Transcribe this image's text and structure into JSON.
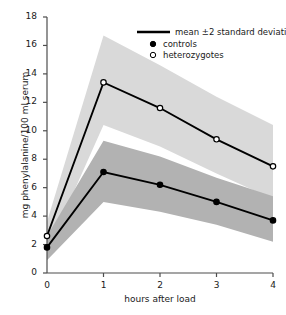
{
  "chart_data": {
    "type": "line",
    "title": "",
    "xlabel": "hours after load",
    "ylabel": "mg phenylalanine/100 ml serum",
    "xlim": [
      0,
      4
    ],
    "ylim": [
      0,
      18
    ],
    "xticks": [
      "0",
      "1",
      "2",
      "3",
      "4"
    ],
    "yticks": [
      "0",
      "2",
      "4",
      "6",
      "8",
      "10",
      "12",
      "14",
      "16",
      "18"
    ],
    "grid": false,
    "legend_position": "top-right",
    "legend": [
      {
        "key": "mean-line",
        "label": "mean ±2 standard deviations",
        "marker": "line"
      },
      {
        "key": "controls",
        "label": "controls",
        "marker": "filled-circle"
      },
      {
        "key": "heterozygotes",
        "label": "heterozygotes",
        "marker": "open-circle"
      }
    ],
    "x": [
      0,
      1,
      2,
      3,
      4
    ],
    "series": [
      {
        "name": "heterozygotes",
        "marker": "open-circle",
        "values": [
          2.6,
          13.4,
          11.6,
          9.4,
          7.5
        ],
        "band_upper": [
          3.6,
          16.7,
          14.6,
          12.4,
          10.4
        ],
        "band_lower": [
          1.5,
          10.4,
          8.9,
          7.0,
          5.2
        ],
        "band_color": "#d9d9d9"
      },
      {
        "name": "controls",
        "marker": "filled-circle",
        "values": [
          1.8,
          7.1,
          6.2,
          5.0,
          3.7
        ],
        "band_upper": [
          2.6,
          9.3,
          8.2,
          6.7,
          5.4
        ],
        "band_lower": [
          0.9,
          5.0,
          4.3,
          3.4,
          2.2
        ],
        "band_color": "#b2b2b2"
      }
    ]
  },
  "colors": {
    "line": "#000000",
    "axis": "#4d4d4d",
    "band_light": "#d9d9d9",
    "band_dark": "#b2b2b2",
    "background": "#ffffff"
  }
}
